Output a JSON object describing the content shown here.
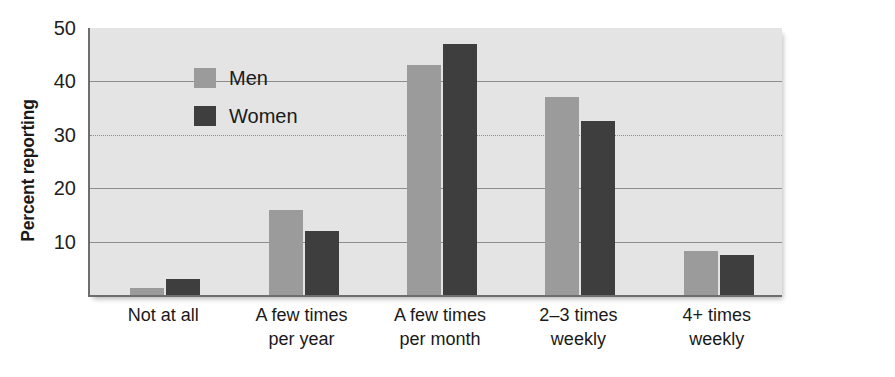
{
  "chart_data": {
    "type": "bar",
    "title": "",
    "xlabel": "",
    "ylabel": "Percent reporting",
    "ylim": [
      0,
      50
    ],
    "yticks": [
      10,
      20,
      30,
      40,
      50
    ],
    "grid": true,
    "legend_position": "top-left",
    "categories": [
      "Not at all",
      "A few times per year",
      "A few times per month",
      "2–3 times weekly",
      "4+ times weekly"
    ],
    "category_lines": [
      [
        "Not at all"
      ],
      [
        "A few times",
        "per year"
      ],
      [
        "A few times",
        "per month"
      ],
      [
        "2–3 times",
        "weekly"
      ],
      [
        "4+ times",
        "weekly"
      ]
    ],
    "series": [
      {
        "name": "Men",
        "color": "#9b9b9b",
        "values": [
          1.3,
          16,
          43,
          37,
          8.3
        ]
      },
      {
        "name": "Women",
        "color": "#3e3e3e",
        "values": [
          3,
          12,
          47,
          32.5,
          7.4
        ]
      }
    ]
  },
  "legend": {
    "items": [
      {
        "label": "Men",
        "swatch": "men"
      },
      {
        "label": "Women",
        "swatch": "women"
      }
    ]
  },
  "colors": {
    "plot_background": "#dddddd",
    "page_background": "#ffffff",
    "axis": "#6e6e6e",
    "gridline": "#8d8d8d",
    "men": "#9b9b9b",
    "women": "#3e3e3e",
    "text": "#1a1a1a"
  }
}
